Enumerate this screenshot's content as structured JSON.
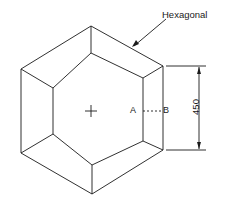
{
  "diagram": {
    "title_label": "Hexagonal",
    "point_a": "A",
    "point_b": "B",
    "dimension": "450",
    "center_mark": "+",
    "colors": {
      "line": "#1a1a1a",
      "background": "#ffffff"
    }
  }
}
